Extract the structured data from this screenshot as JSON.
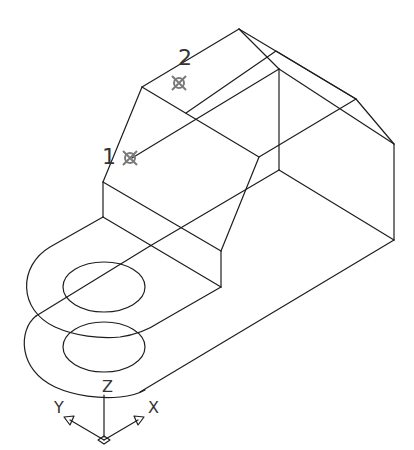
{
  "drawing": {
    "type": "isometric wireframe",
    "point_labels": [
      {
        "id": "1",
        "text": "1"
      },
      {
        "id": "2",
        "text": "2"
      }
    ],
    "ucs_icon": {
      "axes": [
        {
          "name": "Z",
          "text": "Z"
        },
        {
          "name": "Y",
          "text": "Y"
        },
        {
          "name": "X",
          "text": "X"
        }
      ]
    },
    "colors": {
      "line": "#1e1e1e",
      "marker": "#7a7a7a",
      "background": "#ffffff"
    }
  }
}
